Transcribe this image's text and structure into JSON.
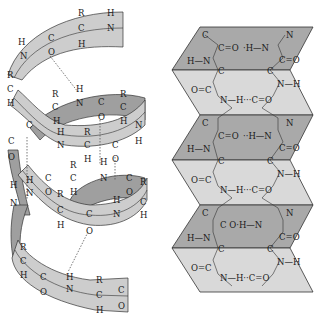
{
  "colors": {
    "background": "#ffffff",
    "helix_front": "#cdcdcd",
    "helix_back": "#9f9f9f",
    "sheet_dark": "#a9a9a9",
    "sheet_light": "#d9d9d9",
    "stroke": "#333333",
    "text": "#1a1a1a"
  },
  "alpha_helix": {
    "turn1": {
      "R1": "R",
      "H1": "H",
      "C1": "C",
      "H2": "H",
      "N1": "N",
      "H3": "H",
      "N2": "N",
      "C2": "C",
      "O1": "O"
    },
    "left_chain": {
      "R": "R",
      "C": "C",
      "H": "H",
      "C2": "C",
      "O": "O",
      "C3": "C",
      "O2": "O"
    },
    "turn2": {
      "R1": "R",
      "H1": "H",
      "C1": "C",
      "N1": "N",
      "C2": "C",
      "O1": "O",
      "R2": "R",
      "C3": "C",
      "H2": "H",
      "H3": "H",
      "C4": "C"
    },
    "turn3": {
      "H1": "H",
      "R1": "R",
      "N1": "N",
      "C1": "C",
      "H2": "H",
      "C2": "C",
      "O1": "O",
      "N2": "N",
      "H3": "H"
    },
    "turn4": {
      "R1": "R",
      "C1": "C",
      "N1": "N",
      "C2": "C",
      "O1": "O",
      "H1": "H",
      "H2": "H",
      "C3": "C",
      "O2": "O",
      "R2": "R"
    },
    "turn5": {
      "H1": "H",
      "N1": "N",
      "H2": "H",
      "N2": "N",
      "R1": "R",
      "C1": "C",
      "H3": "H",
      "C2": "C",
      "O1": "O",
      "N3": "N",
      "H4": "H",
      "C3": "C",
      "H5": "H"
    },
    "turn6": {
      "R1": "R",
      "C1": "C",
      "H1": "H",
      "C2": "C",
      "O1": "O",
      "H2": "H",
      "N1": "N",
      "R2": "R",
      "C3": "C",
      "H3": "H",
      "C4": "C",
      "O2": "O"
    }
  },
  "beta_sheet": {
    "panels": [
      {
        "C_top": "C",
        "carbonyl": "C=O",
        "hbond": "·H—N",
        "N_top": "N",
        "HN": "H—N",
        "C_bot": "C",
        "CO_right": "C=O",
        "C_right": "C"
      },
      {
        "OC": "O=C",
        "NH_bond": "N—H···C=O",
        "NH_right": "N—H"
      },
      {
        "C_top": "C",
        "carbonyl": "C=O",
        "hbond": "··H—N",
        "N_top": "N",
        "HN": "H—N",
        "C_bot": "C",
        "CO_right": "C=O",
        "C_right": "C"
      },
      {
        "OC": "O=C",
        "NH_bond": "N—H···C=O",
        "NH_right": "N—H"
      },
      {
        "C_top": "C",
        "carbonyl": "C  O·H—N",
        "N_top": "N",
        "HN": "H—N",
        "C_bot": "C",
        "CO_right": "C=O",
        "C_right": "C"
      },
      {
        "OC": "O=C",
        "NH_bond": "N—H··C=O",
        "NH_right": "N—H"
      }
    ]
  }
}
